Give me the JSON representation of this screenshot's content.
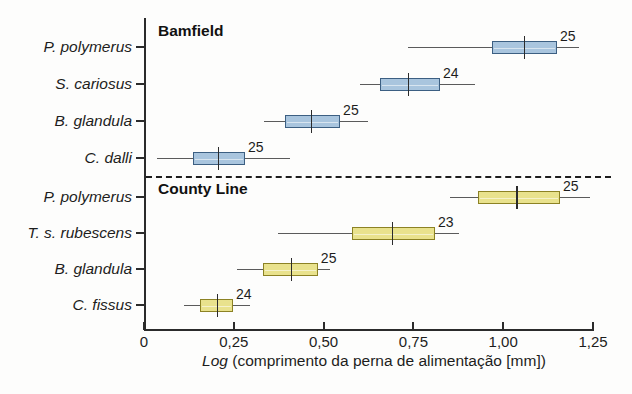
{
  "chart_data": {
    "type": "box",
    "title": "",
    "xlabel": "Log (comprimento da perna de alimentação [mm])",
    "ylabel": "",
    "xlim": [
      0,
      1.25
    ],
    "xticks": [
      0,
      0.25,
      0.5,
      0.75,
      1.0,
      1.25
    ],
    "xticklabels": [
      "0",
      "0,25",
      "0,50",
      "0,75",
      "1,00",
      "1,25"
    ],
    "grid": false,
    "legend": "none",
    "groups": [
      {
        "name": "Bamfield",
        "color": "#a9c5de",
        "border_color": "#3c5f82",
        "rows": [
          {
            "label": "P. polymerus",
            "n": "25",
            "whisker_low": 0.735,
            "q1": 0.969,
            "median": 1.058,
            "q3": 1.15,
            "whisker_high": 1.21
          },
          {
            "label": "S. cariosus",
            "n": "24",
            "whisker_low": 0.601,
            "q1": 0.657,
            "median": 0.735,
            "q3": 0.824,
            "whisker_high": 0.921
          },
          {
            "label": "B. glandula",
            "n": "25",
            "whisker_low": 0.334,
            "q1": 0.392,
            "median": 0.465,
            "q3": 0.546,
            "whisker_high": 0.624
          },
          {
            "label": "C. dalli",
            "n": "25",
            "whisker_low": 0.036,
            "q1": 0.136,
            "median": 0.206,
            "q3": 0.281,
            "whisker_high": 0.406
          }
        ]
      },
      {
        "name": "County Line",
        "color": "#e9e28d",
        "border_color": "#8c8224",
        "rows": [
          {
            "label": "P. polymerus",
            "n": "25",
            "whisker_low": 0.852,
            "q1": 0.93,
            "median": 1.036,
            "q3": 1.158,
            "whisker_high": 1.241
          },
          {
            "label": "T. s. rubescens",
            "n": "23",
            "whisker_low": 0.373,
            "q1": 0.579,
            "median": 0.69,
            "q3": 0.81,
            "whisker_high": 0.876
          },
          {
            "label": "B. glandula",
            "n": "25",
            "whisker_low": 0.259,
            "q1": 0.331,
            "median": 0.409,
            "q3": 0.484,
            "whisker_high": 0.518
          },
          {
            "label": "C. fissus",
            "n": "24",
            "whisker_low": 0.111,
            "q1": 0.156,
            "median": 0.203,
            "q3": 0.248,
            "whisker_high": 0.295
          }
        ]
      }
    ]
  },
  "axis": {
    "x_title_italic": "Log",
    "x_title_rest": " (comprimento da perna de alimentação [mm])"
  }
}
